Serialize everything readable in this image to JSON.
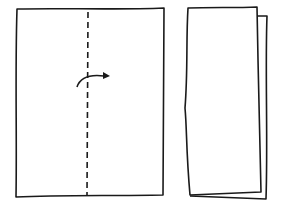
{
  "diagram": {
    "type": "paper-folding-instructions",
    "steps": [
      {
        "id": "step-1",
        "description": "Rectangular sheet with vertical dashed center fold line and curved arrow indicating folding left half over to the right",
        "elements": [
          "sheet-outline",
          "dashed-fold-line",
          "curved-fold-arrow"
        ]
      },
      {
        "id": "step-2",
        "description": "Sheet folded in half lengthwise, showing two offset layers",
        "elements": [
          "front-layer-outline",
          "back-layer-outline"
        ]
      }
    ],
    "colors": {
      "line": "#1a1a1a",
      "background": "#ffffff"
    }
  }
}
